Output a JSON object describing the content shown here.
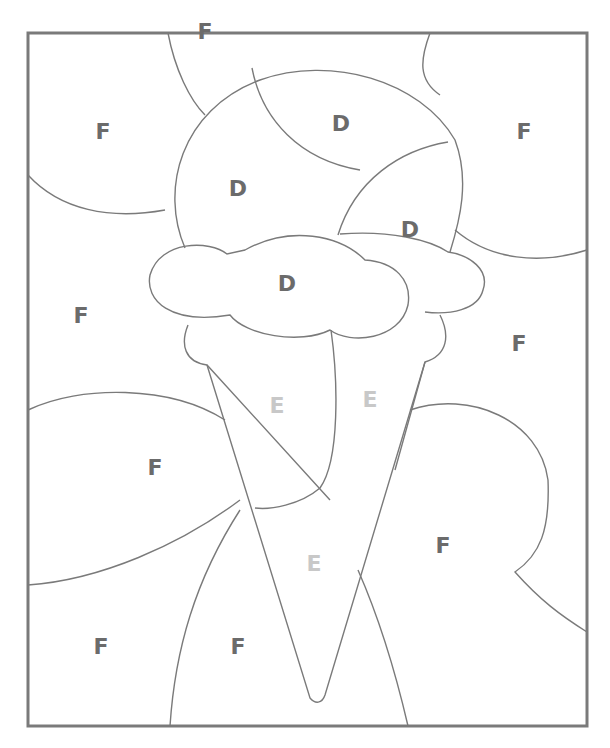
{
  "colors": {
    "line": "#7a7a7a",
    "letter_dark": "#6b6b6b",
    "letter_light": "#c8c8c8"
  },
  "labels": [
    {
      "id": "f1",
      "text": "F",
      "x": 205,
      "y": 32,
      "tone": "dark"
    },
    {
      "id": "f2",
      "text": "F",
      "x": 103,
      "y": 132,
      "tone": "dark"
    },
    {
      "id": "d1",
      "text": "D",
      "x": 341,
      "y": 124,
      "tone": "dark"
    },
    {
      "id": "f3",
      "text": "F",
      "x": 524,
      "y": 132,
      "tone": "dark"
    },
    {
      "id": "d2",
      "text": "D",
      "x": 238,
      "y": 189,
      "tone": "dark"
    },
    {
      "id": "d3",
      "text": "D",
      "x": 410,
      "y": 230,
      "tone": "dark"
    },
    {
      "id": "d4",
      "text": "D",
      "x": 287,
      "y": 284,
      "tone": "dark"
    },
    {
      "id": "f4",
      "text": "F",
      "x": 81,
      "y": 316,
      "tone": "dark"
    },
    {
      "id": "f5",
      "text": "F",
      "x": 519,
      "y": 344,
      "tone": "dark"
    },
    {
      "id": "e1",
      "text": "E",
      "x": 277,
      "y": 406,
      "tone": "light"
    },
    {
      "id": "e2",
      "text": "E",
      "x": 370,
      "y": 400,
      "tone": "light"
    },
    {
      "id": "f6",
      "text": "F",
      "x": 155,
      "y": 468,
      "tone": "dark"
    },
    {
      "id": "f7",
      "text": "F",
      "x": 443,
      "y": 546,
      "tone": "dark"
    },
    {
      "id": "e3",
      "text": "E",
      "x": 314,
      "y": 564,
      "tone": "light"
    },
    {
      "id": "f8",
      "text": "F",
      "x": 101,
      "y": 647,
      "tone": "dark"
    },
    {
      "id": "f9",
      "text": "F",
      "x": 238,
      "y": 647,
      "tone": "dark"
    }
  ]
}
